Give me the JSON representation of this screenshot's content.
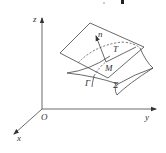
{
  "diagram": {
    "type": "3d-coordinate-surface-tangent-plane",
    "axes": {
      "z_label": "z",
      "y_label": "y",
      "x_label": "x",
      "origin_label": "O"
    },
    "labels": {
      "normal": "n",
      "tangent": "T",
      "point": "M",
      "curve": "Γ",
      "surface": "Σ"
    },
    "colors": {
      "stroke": "#444444",
      "background": "#ffffff"
    }
  }
}
